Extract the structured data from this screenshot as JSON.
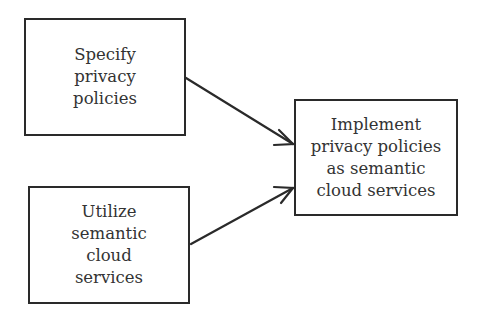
{
  "diagram": {
    "nodes": [
      {
        "id": "specify",
        "lines": [
          "Specify",
          "privacy",
          "policies"
        ]
      },
      {
        "id": "utilize",
        "lines": [
          "Utilize",
          "semantic",
          "cloud",
          "services"
        ]
      },
      {
        "id": "implement",
        "lines": [
          "Implement",
          "privacy policies",
          "as semantic",
          "cloud services"
        ]
      }
    ],
    "edges": [
      {
        "from": "specify",
        "to": "implement"
      },
      {
        "from": "utilize",
        "to": "implement"
      }
    ],
    "colors": {
      "stroke": "#2a2a2a",
      "text": "#333333",
      "background": "#ffffff"
    }
  }
}
